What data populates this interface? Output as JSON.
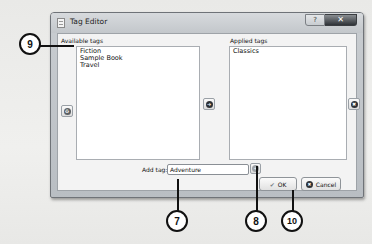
{
  "window": {
    "title": "Tag Editor",
    "help_button": "?",
    "close_button": "✕"
  },
  "available": {
    "label": "Available tags",
    "items": [
      "Fiction",
      "Sample Book",
      "Travel"
    ]
  },
  "applied": {
    "label": "Applied tags",
    "items": [
      "Classics"
    ]
  },
  "buttons": {
    "delete_tag_icon": "recycle-icon",
    "apply_icon": "right-arrow-icon",
    "unapply_icon": "remove-icon",
    "add_tag_icon": "plus-icon",
    "ok": "OK",
    "ok_icon": "✔",
    "cancel": "Cancel",
    "cancel_icon": "✖"
  },
  "add_tag": {
    "label": "Add tag:",
    "value": "Adventure"
  },
  "callouts": {
    "c9": "9",
    "c7": "7",
    "c8": "8",
    "c10": "10"
  }
}
